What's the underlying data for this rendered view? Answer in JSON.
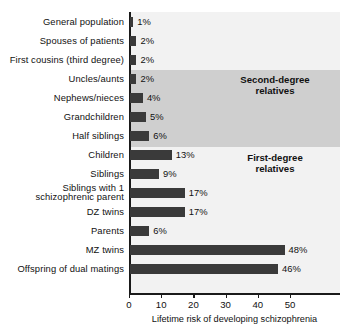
{
  "chart_data": {
    "type": "bar",
    "orientation": "horizontal",
    "title": "",
    "xlabel": "Lifetime risk of developing schizophrenia",
    "ylabel": "",
    "xlim": [
      0,
      55
    ],
    "xticks": [
      0,
      10,
      20,
      30,
      40,
      50
    ],
    "xtick_labels": [
      "0",
      "10",
      "20",
      "30",
      "40",
      "50"
    ],
    "grid": false,
    "legend": "none",
    "value_suffix": "%",
    "bar_color": "#3a3a3a",
    "band_color": "#cfcfcf",
    "plot_background": "#f2f2f2",
    "categories": [
      "General population",
      "Spouses of patients",
      "First cousins (third degree)",
      "Uncles/aunts",
      "Nephews/nieces",
      "Grandchildren",
      "Half siblings",
      "Children",
      "Siblings",
      "Siblings with 1 schizophrenic parent",
      "DZ twins",
      "Parents",
      "MZ twins",
      "Offspring of dual matings"
    ],
    "values": [
      1,
      2,
      2,
      2,
      4,
      5,
      6,
      13,
      9,
      17,
      17,
      6,
      48,
      46
    ],
    "value_labels": [
      "1%",
      "2%",
      "2%",
      "2%",
      "4%",
      "5%",
      "6%",
      "13%",
      "9%",
      "17%",
      "17%",
      "6%",
      "48%",
      "46%"
    ],
    "annotations": [
      {
        "text": "Second-degree relatives",
        "line1": "Second-degree",
        "line2": "relatives"
      },
      {
        "text": "First-degree relatives",
        "line1": "First-degree",
        "line2": "relatives"
      }
    ]
  },
  "rows": [
    {
      "label": "General population",
      "value_label": "1%"
    },
    {
      "label": "Spouses of patients",
      "value_label": "2%"
    },
    {
      "label": "First cousins (third degree)",
      "value_label": "2%"
    },
    {
      "label": "Uncles/aunts",
      "value_label": "2%"
    },
    {
      "label": "Nephews/nieces",
      "value_label": "4%"
    },
    {
      "label": "Grandchildren",
      "value_label": "5%"
    },
    {
      "label": "Half siblings",
      "value_label": "6%"
    },
    {
      "label": "Children",
      "value_label": "13%"
    },
    {
      "label": "Siblings",
      "value_label": "9%"
    },
    {
      "label": "Siblings with 1 schizophrenic parent",
      "label_line1": "Siblings with 1",
      "label_line2": "schizophrenic parent",
      "value_label": "17%"
    },
    {
      "label": "DZ twins",
      "value_label": "17%"
    },
    {
      "label": "Parents",
      "value_label": "6%"
    },
    {
      "label": "MZ twins",
      "value_label": "48%"
    },
    {
      "label": "Offspring of dual matings",
      "value_label": "46%"
    }
  ],
  "groups": {
    "second_degree": {
      "line1": "Second-degree",
      "line2": "relatives"
    },
    "first_degree": {
      "line1": "First-degree",
      "line2": "relatives"
    }
  },
  "axis": {
    "ticks": [
      "0",
      "10",
      "20",
      "30",
      "40",
      "50"
    ],
    "title": "Lifetime risk of developing schizophrenia"
  }
}
